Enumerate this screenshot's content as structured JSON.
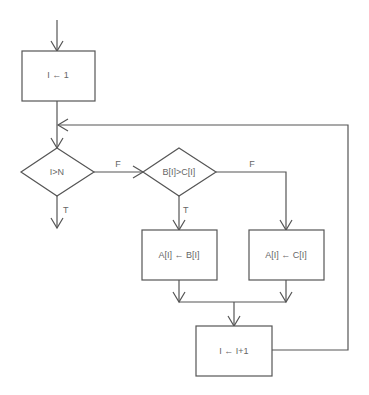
{
  "diagram": {
    "type": "flowchart",
    "nodes": [
      {
        "id": "init",
        "shape": "process",
        "label": "I ← 1"
      },
      {
        "id": "cond1",
        "shape": "decision",
        "label": "I>N"
      },
      {
        "id": "cond2",
        "shape": "decision",
        "label": "B[I]>C[I]"
      },
      {
        "id": "assignB",
        "shape": "process",
        "label": "A[I] ← B[I]"
      },
      {
        "id": "assignC",
        "shape": "process",
        "label": "A[I] ← C[I]"
      },
      {
        "id": "inc",
        "shape": "process",
        "label": "I ← I+1"
      }
    ],
    "edges": [
      {
        "from": "start",
        "to": "init",
        "label": ""
      },
      {
        "from": "init",
        "to": "cond1",
        "label": ""
      },
      {
        "from": "cond1",
        "to": "cond2",
        "label": "F"
      },
      {
        "from": "cond1",
        "to": "end",
        "label": "T"
      },
      {
        "from": "cond2",
        "to": "assignB",
        "label": "T"
      },
      {
        "from": "cond2",
        "to": "assignC",
        "label": "F"
      },
      {
        "from": "assignB",
        "to": "inc",
        "label": ""
      },
      {
        "from": "assignC",
        "to": "inc",
        "label": ""
      },
      {
        "from": "inc",
        "to": "cond1",
        "label": ""
      }
    ],
    "branch_labels": {
      "cond1_false": "F",
      "cond1_true": "T",
      "cond2_false": "F",
      "cond2_true": "T"
    }
  }
}
